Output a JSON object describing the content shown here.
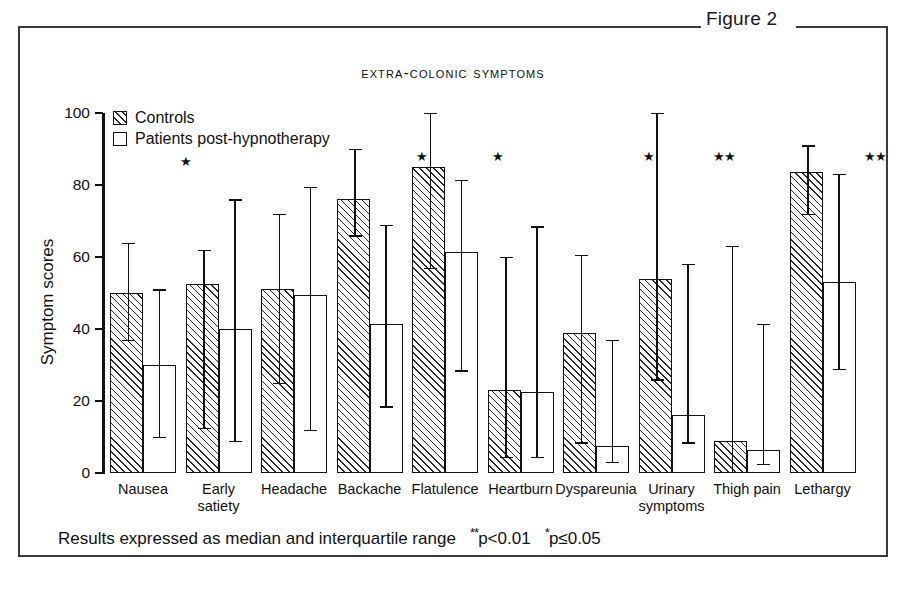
{
  "figure": {
    "label": "Figure 2"
  },
  "chart_title": "Extra-colonic symptoms",
  "axis": {
    "ylabel": "Symptom scores",
    "yticks": [
      "0",
      "20",
      "40",
      "60",
      "80",
      "100"
    ]
  },
  "legend": {
    "items": [
      {
        "label": "Controls",
        "swatch": "hatched-swatch"
      },
      {
        "label": "Patients post-hypnotherapy",
        "swatch": "open-swatch"
      }
    ]
  },
  "footnote": {
    "text": "Results expressed as median and interquartile range",
    "sig_double": "**",
    "sig_double_p": "p<0.01",
    "sig_single": "*",
    "sig_single_p": "p≤0.05"
  },
  "chart_data": {
    "type": "bar",
    "title": "Extra-colonic symptoms",
    "xlabel": "",
    "ylabel": "Symptom scores",
    "ylim": [
      0,
      100
    ],
    "ytick_values": [
      0,
      20,
      40,
      60,
      80,
      100
    ],
    "grid": false,
    "legend_position": "top-left",
    "error_type": "interquartile range (median with IQR)",
    "categories": [
      "Nausea",
      "Early satiety",
      "Headache",
      "Backache",
      "Flatulence",
      "Heartburn",
      "Dyspareunia",
      "Urinary symptoms",
      "Thigh pain",
      "Lethargy"
    ],
    "series": [
      {
        "name": "Controls",
        "fill": "hatched",
        "values": [
          50,
          52.5,
          51,
          76,
          85,
          23,
          39,
          54,
          9,
          83.5
        ],
        "error_low": [
          37,
          12.5,
          25,
          66,
          57,
          4.5,
          8.5,
          26,
          0,
          72
        ],
        "error_high": [
          64,
          62,
          72,
          90,
          100,
          60,
          60.5,
          100,
          63,
          91
        ]
      },
      {
        "name": "Patients post-hypnotherapy",
        "fill": "open",
        "values": [
          30,
          40,
          49.5,
          41.5,
          61.5,
          22.5,
          7.5,
          16,
          6.5,
          53
        ],
        "error_low": [
          10,
          9,
          12,
          18.5,
          28.5,
          4.5,
          3,
          8.5,
          2.5,
          29
        ],
        "error_high": [
          51,
          76,
          79.5,
          69,
          81.5,
          68.5,
          37,
          58,
          41.5,
          83
        ]
      }
    ],
    "significance": [
      {
        "category": "Nausea",
        "mark": "*"
      },
      {
        "category": "Backache",
        "mark": "*"
      },
      {
        "category": "Flatulence",
        "mark": "*"
      },
      {
        "category": "Dyspareunia",
        "mark": "*"
      },
      {
        "category": "Urinary symptoms",
        "mark": "**"
      },
      {
        "category": "Lethargy",
        "mark": "**"
      }
    ]
  }
}
